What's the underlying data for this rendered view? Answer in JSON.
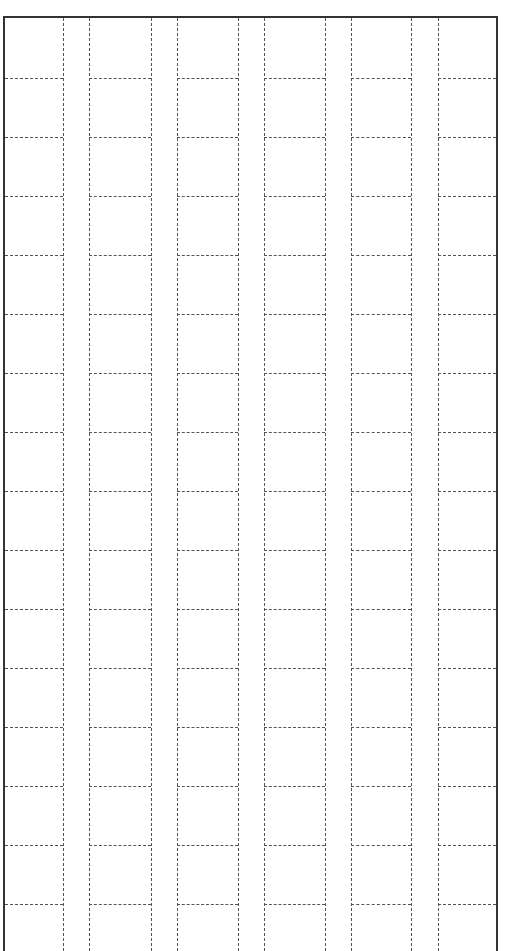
{
  "page": {
    "type": "grid-paper",
    "header_text": "",
    "colors": {
      "border": "#333333",
      "grid": "#555555",
      "background": "#ffffff"
    }
  },
  "grid": {
    "columns": 6,
    "rows": 15,
    "vertical_lines_x": [
      63,
      89,
      151,
      177,
      238,
      264,
      325,
      351,
      411,
      438
    ],
    "horizontal_lines_y": [
      78,
      137,
      196,
      255,
      314,
      373,
      432,
      491,
      550,
      609,
      668,
      727,
      786,
      845,
      904
    ],
    "column_spans": [
      [
        5,
        63
      ],
      [
        89,
        151
      ],
      [
        177,
        238
      ],
      [
        264,
        325
      ],
      [
        351,
        411
      ],
      [
        438,
        496
      ]
    ]
  }
}
